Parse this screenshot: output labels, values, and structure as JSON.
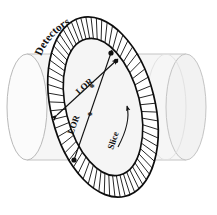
{
  "figure": {
    "name": "pet-scanner-detector-ring-diagram",
    "labels": {
      "detectors": "Detectors",
      "lor_short": "LOR",
      "lor_long": "LOR",
      "slice": "Slice"
    },
    "markers": {
      "annihilation_point_upper": "*",
      "annihilation_point_lower": "*"
    },
    "colors": {
      "ink": "#111111",
      "cylinder_body": "#f5f5f5",
      "cylinder_edge": "#c9c9c9",
      "slice_fill": "#ebebeb",
      "slice_edge": "#a8a8a8",
      "ring_outline": "#111111",
      "detector_hatch": "#1a1a1a",
      "background": "#ffffff"
    },
    "geometry": {
      "ring_center_x": 103,
      "ring_center_y": 107,
      "ring_outer_rx": 52,
      "ring_outer_ry": 92,
      "ring_inner_rx": 37,
      "ring_inner_ry": 70,
      "ring_tilt_deg": -14,
      "detector_segment_count": 64,
      "cylinder_left_cap_cx": 27,
      "cylinder_right_cap_cx": 186,
      "cylinder_cap_rx": 20,
      "cylinder_cap_ry": 53,
      "cylinder_top_y": 57,
      "cylinder_bottom_y": 163
    }
  }
}
